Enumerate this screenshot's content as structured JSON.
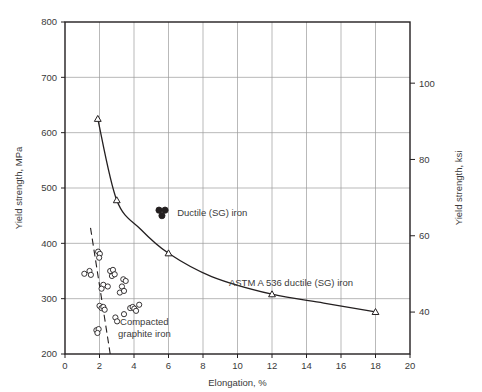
{
  "chart_data": {
    "type": "scatter",
    "title": "",
    "xlabel": "Elongation, %",
    "ylabel": "Yield strength, MPa",
    "ylabel_right": "Yield strength, ksi",
    "xlim": [
      0,
      20
    ],
    "ylim": [
      200,
      800
    ],
    "ylim_right": [
      29,
      116
    ],
    "grid": true,
    "legend": "none",
    "xticks": [
      0,
      2,
      4,
      6,
      8,
      10,
      12,
      14,
      16,
      18,
      20
    ],
    "xtick_labels": [
      "0",
      "2",
      "4",
      "6",
      "8",
      "10",
      "12",
      "14",
      "16",
      "18",
      "20"
    ],
    "yticks": [
      200,
      300,
      400,
      500,
      600,
      700,
      800
    ],
    "ytick_labels": [
      "200",
      "300",
      "400",
      "500",
      "600",
      "700",
      "800"
    ],
    "yticks_right": [
      40,
      60,
      80,
      100
    ],
    "ytick_labels_right": [
      "40",
      "60",
      "80",
      "100"
    ],
    "series": [
      {
        "name": "ASTM A 536 ductile (SG) iron",
        "type": "line",
        "marker": "open-triangle",
        "annotation": "ASTM A 536 ductile (SG) iron",
        "annotation_x": 13.1,
        "annotation_y": 322,
        "points": [
          {
            "x": 1.9,
            "y": 625
          },
          {
            "x": 3.0,
            "y": 478
          },
          {
            "x": 4.4,
            "y": 425
          },
          {
            "x": 6.0,
            "y": 382
          },
          {
            "x": 8.5,
            "y": 340
          },
          {
            "x": 12.0,
            "y": 308
          },
          {
            "x": 15.0,
            "y": 292
          },
          {
            "x": 18.0,
            "y": 276
          }
        ],
        "markers_at": [
          {
            "x": 1.9,
            "y": 625
          },
          {
            "x": 3.0,
            "y": 478
          },
          {
            "x": 6.0,
            "y": 382
          },
          {
            "x": 12.0,
            "y": 308
          },
          {
            "x": 18.0,
            "y": 276
          }
        ]
      },
      {
        "name": "Ductile (SG) iron",
        "type": "scatter",
        "marker": "filled-circle",
        "annotation": "Ductile (SG) iron",
        "annotation_x": 6.5,
        "annotation_y": 455,
        "points": [
          {
            "x": 5.45,
            "y": 460
          },
          {
            "x": 5.8,
            "y": 460
          },
          {
            "x": 5.62,
            "y": 450
          }
        ]
      },
      {
        "name": "Compacted graphite iron",
        "type": "scatter",
        "marker": "open-circle",
        "annotation": "Compacted graphite iron",
        "annotation_x": 4.6,
        "annotation_y": 252,
        "points": [
          {
            "x": 1.92,
            "y": 385
          },
          {
            "x": 2.02,
            "y": 381
          },
          {
            "x": 1.98,
            "y": 374
          },
          {
            "x": 1.12,
            "y": 345
          },
          {
            "x": 1.42,
            "y": 350
          },
          {
            "x": 1.5,
            "y": 343
          },
          {
            "x": 2.62,
            "y": 350
          },
          {
            "x": 2.78,
            "y": 352
          },
          {
            "x": 2.72,
            "y": 341
          },
          {
            "x": 2.88,
            "y": 344
          },
          {
            "x": 2.22,
            "y": 325
          },
          {
            "x": 2.12,
            "y": 318
          },
          {
            "x": 2.48,
            "y": 322
          },
          {
            "x": 3.38,
            "y": 335
          },
          {
            "x": 3.52,
            "y": 332
          },
          {
            "x": 3.3,
            "y": 322
          },
          {
            "x": 3.18,
            "y": 311
          },
          {
            "x": 3.42,
            "y": 314
          },
          {
            "x": 2.0,
            "y": 287
          },
          {
            "x": 2.12,
            "y": 283
          },
          {
            "x": 2.22,
            "y": 285
          },
          {
            "x": 2.3,
            "y": 280
          },
          {
            "x": 3.78,
            "y": 283
          },
          {
            "x": 3.92,
            "y": 285
          },
          {
            "x": 4.02,
            "y": 282
          },
          {
            "x": 4.12,
            "y": 278
          },
          {
            "x": 4.3,
            "y": 289
          },
          {
            "x": 3.42,
            "y": 272
          },
          {
            "x": 2.92,
            "y": 266
          },
          {
            "x": 3.02,
            "y": 259
          },
          {
            "x": 1.82,
            "y": 243
          },
          {
            "x": 1.95,
            "y": 245
          },
          {
            "x": 1.88,
            "y": 238
          }
        ]
      },
      {
        "name": "trend-dashed",
        "type": "dashed-line",
        "points": [
          {
            "x": 1.48,
            "y": 428
          },
          {
            "x": 2.62,
            "y": 200
          }
        ]
      }
    ]
  }
}
